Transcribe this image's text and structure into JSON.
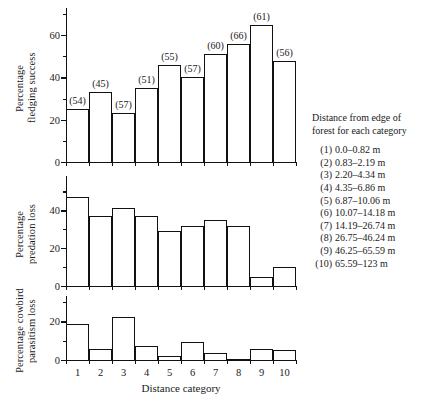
{
  "chart_data": {
    "type": "bar",
    "title": "",
    "xlabel": "Distance category",
    "grid": false,
    "legend_position": "right",
    "categories": [
      "1",
      "2",
      "3",
      "4",
      "5",
      "6",
      "7",
      "8",
      "9",
      "10"
    ],
    "panels": [
      {
        "ylabel_lines": [
          "Percentage",
          "fledging success"
        ],
        "ylabel": "Percentage fledging success",
        "values": [
          25,
          33,
          23,
          35,
          46,
          40,
          51,
          56,
          65,
          48
        ],
        "ylim": [
          0,
          70
        ],
        "yticks_major": [
          0,
          20,
          40,
          60
        ],
        "yticks_minor": [
          10,
          30,
          50,
          70
        ],
        "bar_annotations": [
          "(54)",
          "(45)",
          "(57)",
          "(51)",
          "(55)",
          "(57)",
          "(60)",
          "(66)",
          "(61)",
          "(56)"
        ]
      },
      {
        "ylabel_lines": [
          "Percentage",
          "predation loss"
        ],
        "ylabel": "Percentage predation loss",
        "values": [
          47,
          37,
          41,
          37,
          29,
          32,
          35,
          32,
          5,
          10
        ],
        "ylim": [
          0,
          55
        ],
        "yticks_major": [
          0,
          20,
          40
        ],
        "yticks_minor": [
          10,
          30,
          50
        ],
        "bar_annotations": [
          "",
          "",
          "",
          "",
          "",
          "",
          "",
          "",
          "",
          ""
        ]
      },
      {
        "ylabel_lines": [
          "Percentage cowbird",
          "parasitism loss"
        ],
        "ylabel": "Percentage cowbird parasitism loss",
        "values": [
          18.5,
          5.5,
          22.5,
          7,
          2,
          9.5,
          3.5,
          0,
          5.5,
          5
        ],
        "ylim": [
          0,
          30
        ],
        "yticks_major": [
          0,
          20
        ],
        "yticks_minor": [
          10,
          30
        ],
        "bar_annotations": [
          "",
          "",
          "",
          "",
          "",
          "",
          "",
          "",
          "",
          ""
        ]
      }
    ]
  },
  "legend": {
    "heading_line1": "Distance from edge of",
    "heading_line2": "forest for each category",
    "entries": [
      {
        "num": "(1)",
        "range": "0.0–0.82 m"
      },
      {
        "num": "(2)",
        "range": "0.83–2.19 m"
      },
      {
        "num": "(3)",
        "range": "2.20–4.34 m"
      },
      {
        "num": "(4)",
        "range": "4.35–6.86 m"
      },
      {
        "num": "(5)",
        "range": "6.87–10.06 m"
      },
      {
        "num": "(6)",
        "range": "10.07–14.18 m"
      },
      {
        "num": "(7)",
        "range": "14.19–26.74 m"
      },
      {
        "num": "(8)",
        "range": "26.75–46.24 m"
      },
      {
        "num": "(9)",
        "range": "46.25–65.59 m"
      },
      {
        "num": "(10)",
        "range": "65.59–123 m"
      }
    ]
  },
  "colors": {
    "ink": "#111111",
    "background": "#ffffff",
    "bar_fill": "#ffffff"
  }
}
